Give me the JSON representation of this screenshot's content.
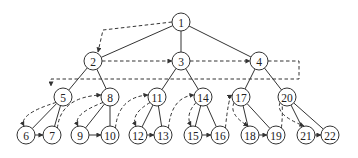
{
  "diagram": {
    "type": "tree-traversal",
    "nodes": [
      {
        "id": "1",
        "label": "1",
        "x": 181,
        "y": 22
      },
      {
        "id": "2",
        "label": "2",
        "x": 93,
        "y": 61
      },
      {
        "id": "3",
        "label": "3",
        "x": 181,
        "y": 61
      },
      {
        "id": "4",
        "label": "4",
        "x": 259,
        "y": 61
      },
      {
        "id": "5",
        "label": "5",
        "x": 63,
        "y": 97
      },
      {
        "id": "8",
        "label": "8",
        "x": 110,
        "y": 97
      },
      {
        "id": "11",
        "label": "11",
        "x": 157,
        "y": 97
      },
      {
        "id": "14",
        "label": "14",
        "x": 203,
        "y": 97
      },
      {
        "id": "17",
        "label": "17",
        "x": 241,
        "y": 97
      },
      {
        "id": "20",
        "label": "20",
        "x": 287,
        "y": 97
      },
      {
        "id": "6",
        "label": "6",
        "x": 26,
        "y": 135
      },
      {
        "id": "7",
        "label": "7",
        "x": 52,
        "y": 135
      },
      {
        "id": "9",
        "label": "9",
        "x": 80,
        "y": 135
      },
      {
        "id": "10",
        "label": "10",
        "x": 110,
        "y": 135
      },
      {
        "id": "12",
        "label": "12",
        "x": 138,
        "y": 135
      },
      {
        "id": "13",
        "label": "13",
        "x": 163,
        "y": 135
      },
      {
        "id": "15",
        "label": "15",
        "x": 193,
        "y": 135
      },
      {
        "id": "16",
        "label": "16",
        "x": 220,
        "y": 135
      },
      {
        "id": "18",
        "label": "18",
        "x": 250,
        "y": 135
      },
      {
        "id": "19",
        "label": "19",
        "x": 276,
        "y": 135
      },
      {
        "id": "21",
        "label": "21",
        "x": 306,
        "y": 135
      },
      {
        "id": "22",
        "label": "22",
        "x": 330,
        "y": 135
      }
    ],
    "tree_edges": [
      [
        "1",
        "2"
      ],
      [
        "1",
        "3"
      ],
      [
        "1",
        "4"
      ],
      [
        "2",
        "5"
      ],
      [
        "2",
        "8"
      ],
      [
        "3",
        "11"
      ],
      [
        "3",
        "14"
      ],
      [
        "4",
        "17"
      ],
      [
        "4",
        "20"
      ],
      [
        "5",
        "6"
      ],
      [
        "5",
        "7"
      ],
      [
        "8",
        "9"
      ],
      [
        "8",
        "10"
      ],
      [
        "11",
        "12"
      ],
      [
        "11",
        "13"
      ],
      [
        "14",
        "15"
      ],
      [
        "14",
        "16"
      ],
      [
        "17",
        "18"
      ],
      [
        "17",
        "19"
      ],
      [
        "20",
        "21"
      ],
      [
        "20",
        "22"
      ]
    ],
    "traversal_arrows": [
      {
        "from": "1",
        "to": "2",
        "style": "dashed"
      },
      {
        "from": "2",
        "to": "3",
        "style": "dashed"
      },
      {
        "from": "3",
        "to": "4",
        "style": "dashed"
      },
      {
        "from": "4",
        "to": "5",
        "style": "dashed",
        "route": "loop-back"
      },
      {
        "from": "5",
        "to": "6",
        "style": "dashed"
      },
      {
        "from": "6",
        "to": "7",
        "style": "solid"
      },
      {
        "from": "7",
        "to": "8",
        "style": "dashed"
      },
      {
        "from": "8",
        "to": "9",
        "style": "dashed"
      },
      {
        "from": "9",
        "to": "10",
        "style": "solid"
      },
      {
        "from": "10",
        "to": "11",
        "style": "dashed"
      },
      {
        "from": "11",
        "to": "12",
        "style": "dashed"
      },
      {
        "from": "12",
        "to": "13",
        "style": "solid"
      },
      {
        "from": "13",
        "to": "14",
        "style": "dashed"
      },
      {
        "from": "14",
        "to": "15",
        "style": "dashed"
      },
      {
        "from": "15",
        "to": "16",
        "style": "solid"
      },
      {
        "from": "16",
        "to": "17",
        "style": "dashed"
      },
      {
        "from": "17",
        "to": "18",
        "style": "dashed"
      },
      {
        "from": "18",
        "to": "19",
        "style": "solid"
      },
      {
        "from": "19",
        "to": "20",
        "style": "dashed"
      },
      {
        "from": "20",
        "to": "21",
        "style": "dashed"
      },
      {
        "from": "21",
        "to": "22",
        "style": "solid"
      }
    ],
    "colors": {
      "stroke": "#333333",
      "background": "#ffffff"
    }
  }
}
